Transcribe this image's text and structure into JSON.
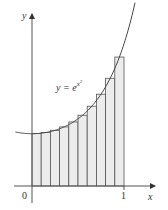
{
  "chart_data": {
    "type": "bar",
    "title": "",
    "function_label": "y = e^{x^2}",
    "function_label_base": "y = e",
    "function_label_exp": "x",
    "function_label_exp2": "2",
    "xlabel": "x",
    "ylabel": "y",
    "x_ticks": [
      {
        "value": 0,
        "label": "0"
      },
      {
        "value": 1,
        "label": "1"
      }
    ],
    "xlim": [
      -0.18,
      1.32
    ],
    "ylim": [
      0,
      3.2
    ],
    "grid": false,
    "rule": "midpoint",
    "n": 10,
    "categories": [
      "0.05",
      "0.15",
      "0.25",
      "0.35",
      "0.45",
      "0.55",
      "0.65",
      "0.75",
      "0.85",
      "0.95"
    ],
    "values": [
      1.0025,
      1.0228,
      1.0645,
      1.1303,
      1.2248,
      1.353,
      1.5259,
      1.7551,
      2.0596,
      2.4659
    ],
    "curve": {
      "expression": "exp(x^2)",
      "x_range": [
        -0.18,
        1.12
      ]
    },
    "colors": {
      "rect_fill": "#ececec",
      "rect_stroke": "#555555",
      "curve": "#444444",
      "axis": "#555555"
    }
  }
}
